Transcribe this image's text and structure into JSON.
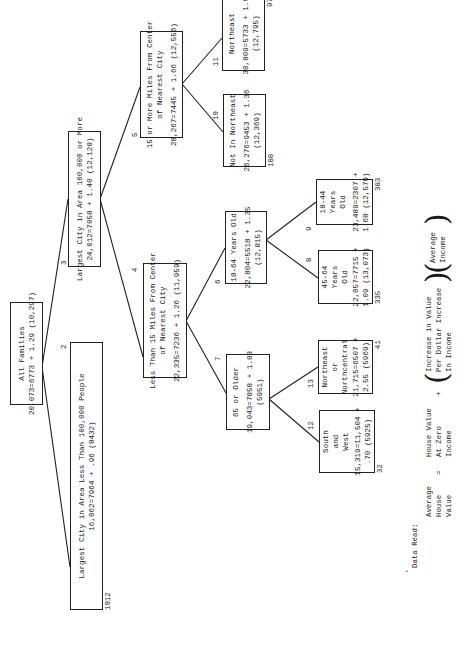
{
  "diagram": {
    "orientation": "rotated 90 degrees counter-clockwise",
    "nodes": [
      {
        "id": "1",
        "number": "",
        "lines": [
          "All Families",
          "20,073=6773 + 1.29 (10,297)"
        ],
        "count": ""
      },
      {
        "id": "2",
        "number": "2",
        "lines": [
          "Largest City in Area Less Than 100,000 People",
          "16,062=7964 + .96 (8432)"
        ],
        "count": "1012"
      },
      {
        "id": "3",
        "number": "3",
        "lines": [
          "Largest City in Area 100,000 or More",
          "24,012=7058 + 1.40 (12,128)"
        ],
        "count": ""
      },
      {
        "id": "4",
        "number": "4",
        "lines": [
          "Less Than 15 Miles From Center",
          "of Nearest City",
          "22,335=7236 + 1.26 (11,959)"
        ],
        "count": ""
      },
      {
        "id": "5",
        "number": "5",
        "lines": [
          "15 or More Miles From Center",
          "of Nearest City",
          "28,267=7445 + 1.66 (12,556)"
        ],
        "count": ""
      },
      {
        "id": "6",
        "number": "6",
        "lines": [
          "18-64 Years Old",
          "22,804=5518 + 1.35",
          "(12,815)"
        ],
        "count": ""
      },
      {
        "id": "7",
        "number": "7",
        "lines": [
          "65 or Older",
          "19,043=7858 + 1.88",
          "(5951)"
        ],
        "count": ""
      },
      {
        "id": "8",
        "number": "8",
        "lines": [
          "45-64",
          "Years",
          "Old",
          "22,057=7715 +",
          "1.09 (13,073)"
        ],
        "count": "335"
      },
      {
        "id": "9",
        "number": "9",
        "lines": [
          "18-44",
          "Years",
          "Old",
          "23,489=2307 +",
          "1.68 (12,579)"
        ],
        "count": "383"
      },
      {
        "id": "10",
        "number": "10",
        "lines": [
          "Not In Northeast",
          "26,276=9453 + 1.36",
          "(12,369)"
        ],
        "count": "188"
      },
      {
        "id": "11",
        "number": "11",
        "lines": [
          "Northeast",
          "30,809=5733 + 1.96",
          "(12,795)"
        ],
        "count": "97"
      },
      {
        "id": "12",
        "number": "12",
        "lines": [
          "South",
          "and",
          "West",
          "15,319=11,504 +",
          ".70 (5925)"
        ],
        "count": "32"
      },
      {
        "id": "13",
        "number": "13",
        "lines": [
          "Northeast",
          "or",
          "Northcentral",
          "21,715=6507 +",
          "2.55 (5969)"
        ],
        "count": "41"
      }
    ],
    "edges": [
      [
        "1",
        "2"
      ],
      [
        "1",
        "3"
      ],
      [
        "3",
        "4"
      ],
      [
        "3",
        "5"
      ],
      [
        "5",
        "10"
      ],
      [
        "5",
        "11"
      ],
      [
        "4",
        "6"
      ],
      [
        "4",
        "7"
      ],
      [
        "6",
        "8"
      ],
      [
        "6",
        "9"
      ],
      [
        "7",
        "12"
      ],
      [
        "7",
        "13"
      ]
    ],
    "legend": {
      "title": "Data Read:",
      "marker": "*",
      "term1": [
        "Average",
        "House",
        "Value"
      ],
      "equals": "=",
      "term2": [
        "House Value",
        "At Zero",
        "Income"
      ],
      "plus": "+",
      "term3": [
        "Increase in Value",
        "Per Dollar Increase",
        "In Income"
      ],
      "term4": [
        "Average",
        "Income"
      ]
    }
  }
}
